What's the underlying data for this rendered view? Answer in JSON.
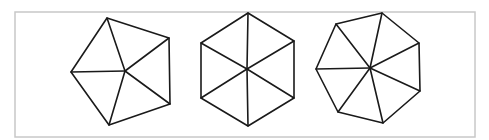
{
  "figure": {
    "frame": {
      "x": 15,
      "y": 12,
      "width": 460,
      "height": 125,
      "stroke": "#c8c8c8"
    },
    "line_color": "#1a1a1a",
    "shapes": [
      {
        "name": "pentagon",
        "sides": 5,
        "triangles": 5,
        "center": [
          125,
          71
        ],
        "vertices": [
          [
            107,
            18
          ],
          [
            169,
            38
          ],
          [
            170,
            104
          ],
          [
            109,
            125
          ],
          [
            71,
            72
          ]
        ]
      },
      {
        "name": "hexagon",
        "sides": 6,
        "triangles": 6,
        "center": [
          247,
          69
        ],
        "vertices": [
          [
            248,
            13
          ],
          [
            294,
            41
          ],
          [
            294,
            98
          ],
          [
            248,
            126
          ],
          [
            201,
            98
          ],
          [
            201,
            43
          ]
        ]
      },
      {
        "name": "heptagon",
        "sides": 7,
        "triangles": 7,
        "center": [
          370,
          68
        ],
        "vertices": [
          [
            382,
            13
          ],
          [
            419,
            43
          ],
          [
            420,
            91
          ],
          [
            383,
            123
          ],
          [
            338,
            112
          ],
          [
            316,
            69
          ],
          [
            336,
            24
          ]
        ]
      }
    ]
  }
}
